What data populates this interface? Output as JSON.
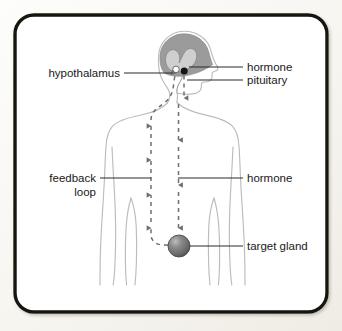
{
  "figure": {
    "frame_color": "#14120f",
    "page_background": "#f7f5f0",
    "panel_background": "#ffffff"
  },
  "labels": {
    "hypothalamus": "hypothalamus",
    "hormone_top": "hormone",
    "pituitary": "pituitary",
    "feedback_line1": "feedback",
    "feedback_line2": "loop",
    "hormone_mid": "hormone",
    "target_gland": "target gland"
  },
  "anatomy": {
    "body_outline_color": "#b9b9b9",
    "brain_fill_color": "#9a9a9a",
    "brain_inner_fill_color": "#c9c9c9",
    "hypothalamus_marker": "white-dot",
    "hypothalamus_marker_color": "#ffffff",
    "pituitary_marker": "black-dot",
    "pituitary_marker_color": "#111111",
    "target_gland_marker": "gray-sphere",
    "target_gland_color": "#6e6e6e"
  },
  "flows": {
    "hormone_down_arrow": "down-arrow",
    "feedback_up_arrow": "up-arrow",
    "arrow_color": "#6f6f6f",
    "leader_line_color": "#2a2a2a"
  }
}
